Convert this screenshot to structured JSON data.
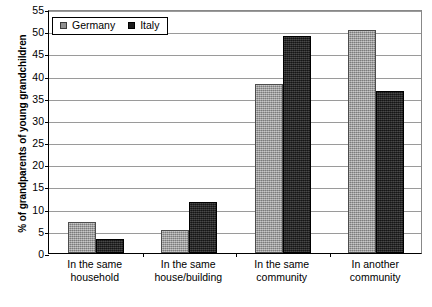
{
  "chart_data": {
    "type": "bar",
    "title": "",
    "subtitle": "",
    "xlabel": "",
    "ylabel": "% of grandparents of young grandchildren",
    "ylim": [
      0,
      55
    ],
    "ytick_step": 5,
    "yticks": [
      0,
      5,
      10,
      15,
      20,
      25,
      30,
      35,
      40,
      45,
      50,
      55
    ],
    "ytick_labels": [
      "0",
      "5",
      "10",
      "15",
      "20",
      "25",
      "30",
      "35",
      "40",
      "45",
      "50",
      "55"
    ],
    "grid": true,
    "legend_position": "top-left",
    "categories": [
      "In the same household",
      "In the same house/building",
      "In the same community",
      "In another community"
    ],
    "category_lines": [
      [
        "In the same",
        "household"
      ],
      [
        "In the same",
        "house/building"
      ],
      [
        "In the same",
        "community"
      ],
      [
        "In another",
        "community"
      ]
    ],
    "series": [
      {
        "name": "Germany",
        "color": "#9c9c9c",
        "values": [
          7.1,
          5.2,
          38.0,
          50.2
        ]
      },
      {
        "name": "Italy",
        "color": "#242424",
        "values": [
          3.2,
          11.5,
          49.0,
          36.6
        ]
      }
    ]
  },
  "legend": {
    "entries": [
      {
        "label": "Germany"
      },
      {
        "label": "Italy"
      }
    ]
  }
}
